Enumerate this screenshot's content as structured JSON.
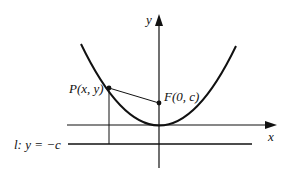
{
  "diagram": {
    "labels": {
      "y_axis": "y",
      "x_axis": "x",
      "point_p": "P(x, y)",
      "focus": "F(0, c)",
      "directrix": "l: y = −c"
    },
    "colors": {
      "ink": "#111111",
      "background": "#ffffff"
    },
    "geometry": {
      "origin_px": [
        159,
        125
      ],
      "vertex_px": [
        159,
        125
      ],
      "focus_px": [
        159,
        103
      ],
      "point_p_px": [
        109,
        88
      ],
      "directrix_y_px": 144,
      "x_axis_y_px": 125,
      "y_axis_x_px": 159
    }
  }
}
